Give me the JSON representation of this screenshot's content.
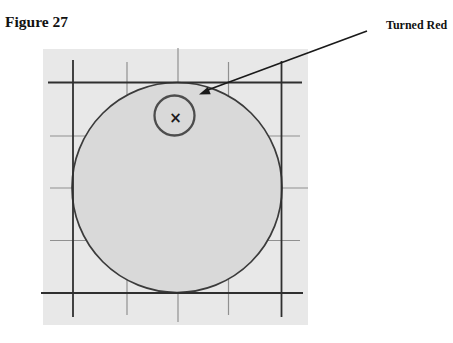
{
  "figure": {
    "label": "Figure 27"
  },
  "annotation": {
    "label": "Turned Red",
    "marker": "×"
  },
  "colors": {
    "page_bg": "#ffffff",
    "panel_bg": "#e8e8e8",
    "large_circle_fill": "#d9d9d9",
    "large_circle_stroke": "#3b3b3b",
    "small_circle_stroke": "#4d4d4d",
    "grid_major": "#2f2f2f",
    "grid_minor": "#909090",
    "arrow": "#1a1a1a",
    "marker": "#1c1c1c",
    "text": "#111111"
  }
}
